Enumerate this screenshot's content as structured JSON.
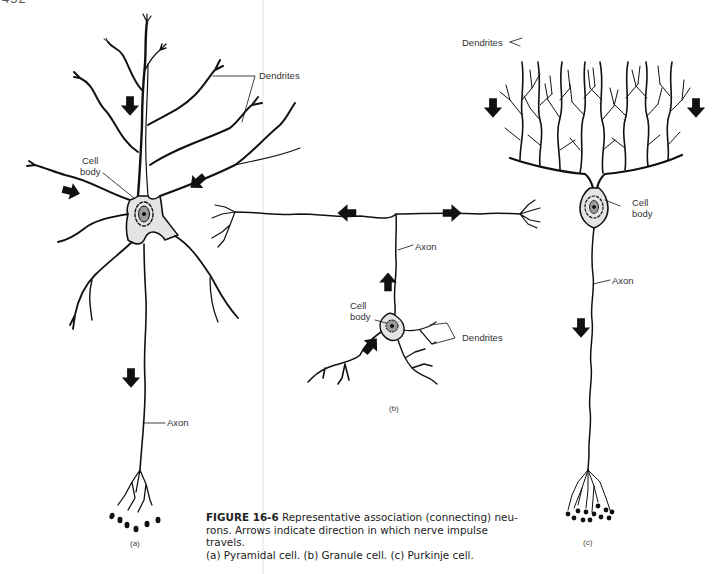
{
  "page": {
    "number": "452"
  },
  "figure": {
    "id": "FIGURE 16-6",
    "caption_lines": [
      "Representative association (connecting) neu-",
      "rons. Arrows indicate direction in which nerve impulse travels.",
      "(a) Pyramidal cell. (b) Granule cell. (c) Purkinje cell."
    ],
    "panels": [
      {
        "key": "a",
        "sublabel": "(a)",
        "name": "Pyramidal cell",
        "labels": {
          "dendrites": "Dendrites",
          "cell_body_1": "Cell",
          "cell_body_2": "body",
          "axon": "Axon"
        }
      },
      {
        "key": "b",
        "sublabel": "(b)",
        "name": "Granule cell",
        "labels": {
          "dendrites": "Dendrites",
          "cell_body_1": "Cell",
          "cell_body_2": "body",
          "axon": "Axon"
        }
      },
      {
        "key": "c",
        "sublabel": "(c)",
        "name": "Purkinje cell",
        "labels": {
          "dendrites": "Dendrites",
          "cell_body_1": "Cell",
          "cell_body_2": "body",
          "axon": "Axon"
        }
      }
    ]
  },
  "colors": {
    "ink": "#111111",
    "soma_fill": "#e4e4e4",
    "nucleus_fill": "#9a9a9a",
    "gutter": "#f1f1f1"
  }
}
